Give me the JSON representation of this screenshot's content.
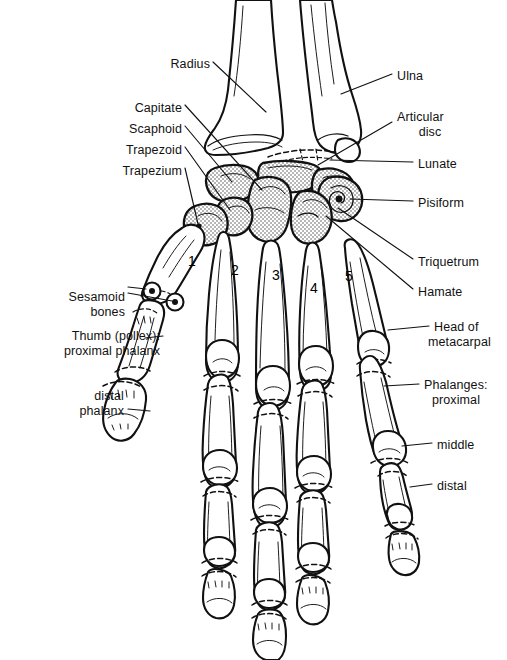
{
  "figure": {
    "background_color": "#ffffff",
    "ink_color": "#111111",
    "stipple_fill": "carpal bones shown with stippled (dotted) shading",
    "width": 507,
    "height": 660
  },
  "labels_left": [
    {
      "id": "radius",
      "text": "Radius",
      "x": 148,
      "y": 57,
      "align": "right",
      "w": 62
    },
    {
      "id": "capitate",
      "text": "Capitate",
      "x": 120,
      "y": 101,
      "align": "right",
      "w": 62
    },
    {
      "id": "scaphoid",
      "text": "Scaphoid",
      "x": 104,
      "y": 122,
      "align": "right",
      "w": 78
    },
    {
      "id": "trapezoid",
      "text": "Trapezoid",
      "x": 100,
      "y": 143,
      "align": "right",
      "w": 82
    },
    {
      "id": "trapezium",
      "text": "Trapezium",
      "x": 88,
      "y": 164,
      "align": "right",
      "w": 94
    }
  ],
  "labels_left_lower": [
    {
      "id": "sesamoid",
      "line1": "Sesamoid",
      "line2": "bones",
      "x": 33,
      "y": 290,
      "w": 92
    },
    {
      "id": "thumb",
      "line1": "Thumb (pollex):",
      "line2": "proximal phalanx",
      "x": 22,
      "y": 329,
      "w": 138
    },
    {
      "id": "distal-ph",
      "line1": "distal",
      "line2": "phalanx",
      "x": 38,
      "y": 389,
      "w": 86
    }
  ],
  "labels_right": [
    {
      "id": "ulna",
      "text": "Ulna",
      "x": 397,
      "y": 69,
      "w": 40
    },
    {
      "id": "articular",
      "line1": "Articular",
      "line2": "disc",
      "x": 397,
      "y": 110,
      "w": 66
    },
    {
      "id": "lunate",
      "text": "Lunate",
      "x": 418,
      "y": 157,
      "w": 52
    },
    {
      "id": "pisiform",
      "text": "Pisiform",
      "x": 418,
      "y": 196,
      "w": 58
    },
    {
      "id": "triquetrum",
      "text": "Triquetrum",
      "x": 418,
      "y": 255,
      "w": 76
    },
    {
      "id": "hamate",
      "text": "Hamate",
      "x": 418,
      "y": 285,
      "w": 54
    }
  ],
  "labels_right_lower": [
    {
      "id": "head-metacarpal",
      "line1": "Head of",
      "line2": "metacarpal",
      "x": 434,
      "y": 320,
      "w": 74
    },
    {
      "id": "phalanges-prox",
      "line1": "Phalanges:",
      "line2": "proximal",
      "x": 424,
      "y": 378,
      "w": 82
    },
    {
      "id": "middle",
      "text": "middle",
      "x": 437,
      "y": 438,
      "w": 48
    },
    {
      "id": "distal",
      "text": "distal",
      "x": 437,
      "y": 479,
      "w": 42
    }
  ],
  "metacarpal_numbers": [
    {
      "id": "mc-1",
      "text": "1",
      "x": 188,
      "y": 253
    },
    {
      "id": "mc-2",
      "text": "2",
      "x": 231,
      "y": 262
    },
    {
      "id": "mc-3",
      "text": "3",
      "x": 272,
      "y": 267
    },
    {
      "id": "mc-4",
      "text": "4",
      "x": 310,
      "y": 280
    },
    {
      "id": "mc-5",
      "text": "5",
      "x": 345,
      "y": 268
    }
  ],
  "leader_lines": {
    "description": "thin black pointer lines connecting text labels to bones"
  }
}
